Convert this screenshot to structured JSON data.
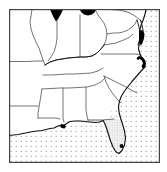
{
  "figure": {
    "type": "distribution-map",
    "caption": "",
    "width": 167,
    "height": 172
  },
  "frame": {
    "name": "map-border",
    "x": 9,
    "y": 9,
    "width": 151,
    "height": 154,
    "stroke_color": "#444444",
    "stroke_width": 1.2,
    "fill_color": "#ffffff"
  },
  "colors": {
    "land_fill": "#ffffff",
    "coastline": "#1a1a1a",
    "state_border": "#555555",
    "water_stipple": "#777777",
    "occurrence_marker": "#000000",
    "shaded_range": "#8a8a8a",
    "background": "#ffffff"
  },
  "legend": {
    "visible": false,
    "entries": [
      {
        "label": "Solid black marker",
        "symbol": "filled-polygon",
        "color": "#000000"
      },
      {
        "label": "Stippled shading",
        "symbol": "dot-hatch",
        "color": "#8a8a8a"
      },
      {
        "label": "Open water",
        "symbol": "dot-grid",
        "color": "#777777"
      }
    ]
  },
  "water": {
    "stipple_spacing_px": 5,
    "dot_radius_px": 0.55,
    "regions": [
      {
        "name": "atlantic-ocean",
        "label": "Atlantic Ocean"
      },
      {
        "name": "gulf-of-mexico",
        "label": "Gulf of Mexico"
      }
    ]
  },
  "shaded_regions": [
    {
      "name": "florida-peninsula-range",
      "label": "Florida peninsula shaded range",
      "stipple_spacing_px": 2.6,
      "dot_radius_px": 0.5,
      "color": "#8a8a8a"
    }
  ],
  "markers": [
    {
      "name": "marker-lake-michigan-tip",
      "label": "Lake Michigan southern tip",
      "x": 56,
      "y": 14
    },
    {
      "name": "marker-lake-erie",
      "label": "Lake Erie western basin",
      "x": 87,
      "y": 13
    },
    {
      "name": "marker-chesapeake-delmarva",
      "label": "Chesapeake Bay / Delmarva",
      "x": 142,
      "y": 36
    },
    {
      "name": "marker-cape-hatteras",
      "label": "Cape Hatteras / Outer Banks",
      "x": 144,
      "y": 63
    },
    {
      "name": "marker-mississippi-delta",
      "label": "Mississippi River delta",
      "x": 63,
      "y": 126
    },
    {
      "name": "marker-south-florida",
      "label": "South Florida point",
      "x": 124,
      "y": 153
    }
  ],
  "states": [
    {
      "name": "state-missouri",
      "label": "Missouri"
    },
    {
      "name": "state-illinois",
      "label": "Illinois"
    },
    {
      "name": "state-indiana",
      "label": "Indiana"
    },
    {
      "name": "state-ohio",
      "label": "Ohio"
    },
    {
      "name": "state-kentucky",
      "label": "Kentucky"
    },
    {
      "name": "state-west-virginia",
      "label": "West Virginia"
    },
    {
      "name": "state-virginia",
      "label": "Virginia"
    },
    {
      "name": "state-maryland",
      "label": "Maryland"
    },
    {
      "name": "state-tennessee",
      "label": "Tennessee"
    },
    {
      "name": "state-north-carolina",
      "label": "North Carolina"
    },
    {
      "name": "state-south-carolina",
      "label": "South Carolina"
    },
    {
      "name": "state-georgia",
      "label": "Georgia"
    },
    {
      "name": "state-alabama",
      "label": "Alabama"
    },
    {
      "name": "state-mississippi",
      "label": "Mississippi"
    },
    {
      "name": "state-arkansas",
      "label": "Arkansas"
    },
    {
      "name": "state-louisiana",
      "label": "Louisiana"
    },
    {
      "name": "state-florida",
      "label": "Florida"
    }
  ]
}
